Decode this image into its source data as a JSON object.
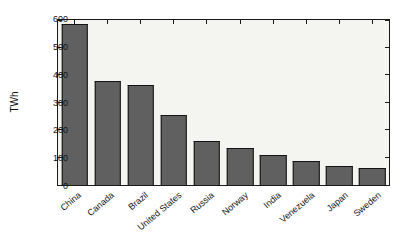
{
  "chart_data": {
    "type": "bar",
    "categories": [
      "China",
      "Canada",
      "Brazil",
      "United States",
      "Russia",
      "Norway",
      "India",
      "Venezuela",
      "Japan",
      "Sweden"
    ],
    "values": [
      585,
      380,
      365,
      255,
      160,
      135,
      110,
      88,
      70,
      62
    ],
    "title": "",
    "xlabel": "",
    "ylabel": "TWh",
    "ylim": [
      0,
      600
    ],
    "yticks": [
      0,
      100,
      200,
      300,
      400,
      500,
      600
    ],
    "bar_width_fraction": 0.8,
    "grid": false,
    "legend": null,
    "styles": {
      "bar_fill": "#606060",
      "bar_edge": "#141414",
      "axis_color": "#1a1a1a",
      "plot_background": "#f4f4f0",
      "figure_background": "#ffffff",
      "text_color": "#111111"
    }
  }
}
